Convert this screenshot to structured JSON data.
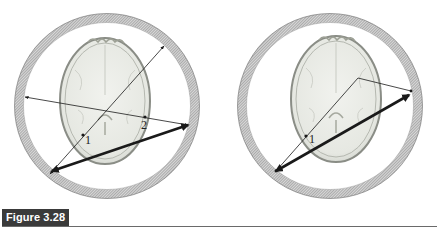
{
  "figure": {
    "caption": "Figure 3.28",
    "panels": [
      {
        "id": "left",
        "description": "Detector ring around axial brain slice; two single-photon paths (thin) and one coincidence line (thick double arrow)",
        "ring": {
          "cx": 107,
          "cy": 106,
          "r": 88
        },
        "brain": {
          "cx": 105,
          "cy": 101,
          "rx": 45,
          "ry": 63
        },
        "points": [
          {
            "label": "1",
            "x": 83,
            "y": 135
          },
          {
            "label": "2",
            "x": 145,
            "y": 117
          }
        ],
        "thin_lines": [
          {
            "from": [
              25,
              97
            ],
            "to": [
              188,
              125
            ]
          },
          {
            "from": [
              50,
              174
            ],
            "to": [
              164,
              46
            ]
          }
        ],
        "thick_line": {
          "from": [
            52,
            171
          ],
          "to": [
            188,
            125
          ]
        }
      },
      {
        "id": "right",
        "description": "Detector ring around axial brain slice; scattered path (thin, bent) and mispositioned coincidence line (thick double arrow)",
        "ring": {
          "cx": 330,
          "cy": 106,
          "r": 88
        },
        "brain": {
          "cx": 336,
          "cy": 99,
          "rx": 45,
          "ry": 63
        },
        "points": [
          {
            "label": "1",
            "x": 306,
            "y": 136
          }
        ],
        "thin_lines": [
          {
            "from": [
              276,
              171
            ],
            "to": [
              358,
              78
            ]
          },
          {
            "from": [
              358,
              78
            ],
            "to": [
              411,
              91
            ]
          }
        ],
        "thick_line": {
          "from": [
            276,
            171
          ],
          "to": [
            409,
            95
          ]
        }
      }
    ]
  },
  "colors": {
    "caption_bg": "#3a3a3a",
    "caption_text": "#ffffff",
    "ring": "#9a9a9a",
    "line": "#1a1a1a",
    "brain_fill": "#e9ebe6",
    "brain_edge": "#8a8d86"
  }
}
